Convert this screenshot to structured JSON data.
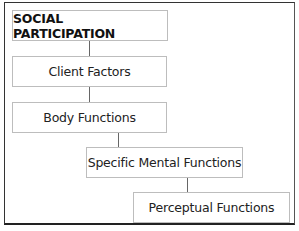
{
  "diagram": {
    "type": "hierarchy",
    "nodes": [
      {
        "id": "social",
        "label": "SOCIAL PARTICIPATION",
        "bold": true
      },
      {
        "id": "client",
        "label": "Client Factors"
      },
      {
        "id": "body",
        "label": "Body Functions"
      },
      {
        "id": "mental",
        "label": "Specific Mental Functions"
      },
      {
        "id": "perceptual",
        "label": "Perceptual Functions"
      }
    ],
    "edges": [
      [
        "social",
        "client"
      ],
      [
        "client",
        "body"
      ],
      [
        "body",
        "mental"
      ],
      [
        "mental",
        "perceptual"
      ]
    ]
  }
}
